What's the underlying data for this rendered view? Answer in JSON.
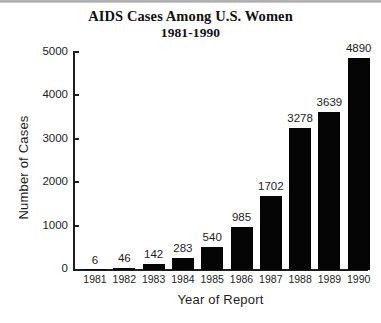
{
  "chart_data": {
    "type": "bar",
    "title": "AIDS Cases Among U.S. Women",
    "subtitle": "1981-1990",
    "xlabel": "Year of Report",
    "ylabel": "Number of Cases",
    "categories": [
      "1981",
      "1982",
      "1983",
      "1984",
      "1985",
      "1986",
      "1987",
      "1988",
      "1989",
      "1990"
    ],
    "values": [
      6,
      46,
      142,
      283,
      540,
      985,
      1702,
      3278,
      3639,
      4890
    ],
    "value_labels": [
      "6",
      "46",
      "142",
      "283",
      "540",
      "985",
      "1702",
      "3278",
      "3639",
      "4890"
    ],
    "ylim": [
      0,
      5000
    ],
    "y_ticks": [
      0,
      1000,
      2000,
      3000,
      4000,
      5000
    ],
    "y_tick_labels": [
      "0",
      "1000",
      "2000",
      "3000",
      "4000",
      "5000"
    ],
    "grid": false,
    "legend": "none",
    "bar_color": "#050505",
    "axis_color": "#1d1d1d",
    "background_color": "#ffffff"
  }
}
